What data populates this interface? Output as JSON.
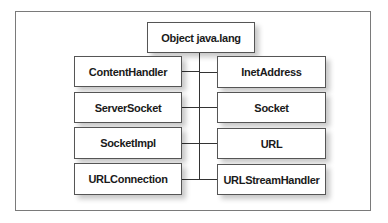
{
  "diagram": {
    "root": {
      "label": "Object java.lang"
    },
    "left_column": [
      {
        "label": "ContentHandler"
      },
      {
        "label": "ServerSocket"
      },
      {
        "label": "SocketImpl"
      },
      {
        "label": "URLConnection"
      }
    ],
    "right_column": [
      {
        "label": "InetAddress"
      },
      {
        "label": "Socket"
      },
      {
        "label": "URL"
      },
      {
        "label": "URLStreamHandler"
      }
    ],
    "edges": [
      {
        "from": "Object java.lang",
        "to": "ContentHandler"
      },
      {
        "from": "Object java.lang",
        "to": "ServerSocket"
      },
      {
        "from": "Object java.lang",
        "to": "SocketImpl"
      },
      {
        "from": "Object java.lang",
        "to": "URLConnection"
      },
      {
        "from": "Object java.lang",
        "to": "InetAddress"
      },
      {
        "from": "Object java.lang",
        "to": "Socket"
      },
      {
        "from": "Object java.lang",
        "to": "URL"
      },
      {
        "from": "Object java.lang",
        "to": "URLStreamHandler"
      }
    ],
    "colors": {
      "box_border": "#555555",
      "line": "#333333",
      "frame": "#7a7a7a",
      "text": "#1a1a1a"
    }
  }
}
